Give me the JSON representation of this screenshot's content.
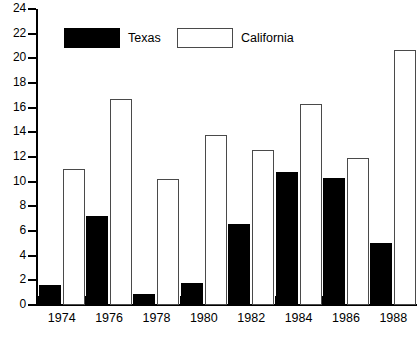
{
  "chart_data": {
    "type": "bar",
    "title": "",
    "xlabel": "",
    "ylabel": "",
    "categories": [
      "1974",
      "1976",
      "1978",
      "1980",
      "1982",
      "1984",
      "1986",
      "1988"
    ],
    "series": [
      {
        "name": "Texas",
        "color": "#000000",
        "style": "filled",
        "values": [
          1.6,
          7.2,
          0.9,
          1.8,
          6.6,
          10.8,
          10.3,
          5.0
        ]
      },
      {
        "name": "California",
        "color": "#ffffff",
        "style": "outlined",
        "values": [
          11.0,
          16.7,
          10.2,
          13.8,
          12.6,
          16.3,
          11.9,
          20.7
        ]
      }
    ],
    "ylim": [
      0,
      24
    ],
    "ytick_step": 2,
    "yticks": [
      "0",
      "2",
      "4",
      "6",
      "8",
      "10",
      "12",
      "14",
      "16",
      "18",
      "20",
      "22",
      "24"
    ],
    "grid": false,
    "legend_position": "top",
    "legend": [
      {
        "label": "Texas",
        "swatch": "filled-black"
      },
      {
        "label": "California",
        "swatch": "outlined-white"
      }
    ]
  },
  "axes": {
    "y_axis_name": "y-axis",
    "x_axis_name": "x-axis"
  }
}
